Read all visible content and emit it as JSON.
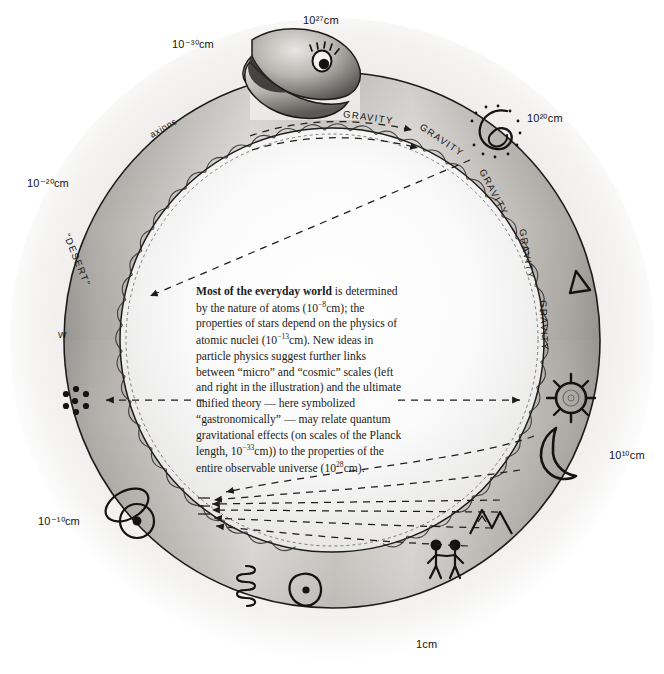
{
  "figure": {
    "type": "ouroboros-scale-diagram",
    "title_text": "Ouroboros of scales",
    "background": "#ffffff",
    "halo_color": "#e9e9e9",
    "snake_light": "#f2f0ee",
    "snake_mid": "#a9a6a2",
    "snake_dark": "#3a3836",
    "ink": "#151515"
  },
  "caption": {
    "lead": "Most of the everyday world",
    "body_1": " is determined by the nature of atoms (10",
    "exp_atom": "−8",
    "body_2": "cm); the properties of stars depend on the physics of atomic nuclei (10",
    "exp_nucleus": "−13",
    "body_3": "cm). New ideas in particle physics suggest further links between “micro” and “cosmic” scales (left and right in the illustration) and the ultimate unified theory — here symbolized “gastronomically” — may relate quantum gravitational effects (on scales of the Planck length, 10",
    "exp_planck": "−33",
    "body_4": "cm)) to the properties of the entire observable universe (10",
    "exp_universe": "28",
    "body_5": "cm)."
  },
  "scale_labels": [
    {
      "id": "top",
      "base": "10",
      "exp": "27",
      "unit": "cm",
      "text": "10²⁷cm",
      "x": 303,
      "y": 14,
      "angle_deg": 90
    },
    {
      "id": "upper-left",
      "base": "10",
      "exp": "−30",
      "unit": "cm",
      "text": "10⁻³⁰cm",
      "x": 172,
      "y": 38,
      "angle_deg": 125
    },
    {
      "id": "left",
      "base": "10",
      "exp": "−20",
      "unit": "cm",
      "text": "10⁻²⁰cm",
      "x": 27,
      "y": 177,
      "angle_deg": 160
    },
    {
      "id": "lower-left",
      "base": "10",
      "exp": "−10",
      "unit": "cm",
      "text": "10⁻¹⁰cm",
      "x": 38,
      "y": 515,
      "angle_deg": 205
    },
    {
      "id": "bottom",
      "base": "1",
      "exp": "",
      "unit": "cm",
      "text": "1cm",
      "x": 416,
      "y": 638,
      "angle_deg": 270
    },
    {
      "id": "lower-right",
      "base": "10",
      "exp": "10",
      "unit": "cm",
      "text": "10¹⁰cm",
      "x": 609,
      "y": 449,
      "angle_deg": 330
    },
    {
      "id": "upper-right",
      "base": "10",
      "exp": "20",
      "unit": "cm",
      "text": "10²⁰cm",
      "x": 527,
      "y": 112,
      "angle_deg": 55
    }
  ],
  "body_words": [
    {
      "id": "gravity-1",
      "text": "GRAVITY",
      "x": 344,
      "y": 108,
      "rotate": 8
    },
    {
      "id": "gravity-2",
      "text": "GRAVITY",
      "x": 424,
      "y": 121,
      "rotate": 34
    },
    {
      "id": "gravity-3",
      "text": "GRAVITY",
      "x": 487,
      "y": 167,
      "rotate": 62
    },
    {
      "id": "gravity-4",
      "text": "GRAVITY",
      "x": 528,
      "y": 228,
      "rotate": 80
    },
    {
      "id": "gravity-5",
      "text": "GRAVITY",
      "x": 549,
      "y": 300,
      "rotate": 88
    },
    {
      "id": "axions",
      "text": "axions",
      "x": 148,
      "y": 131,
      "rotate": -30
    },
    {
      "id": "desert",
      "text": "“DESERT”",
      "x": 72,
      "y": 232,
      "rotate": 68
    },
    {
      "id": "wboson",
      "text": "W",
      "x": 58,
      "y": 330,
      "rotate": 0
    }
  ],
  "symbols": [
    {
      "id": "eye",
      "name": "snake-eye-icon",
      "x": 321,
      "y": 60,
      "label": "eye of the serpent"
    },
    {
      "id": "spiral-galaxy",
      "name": "spiral-galaxy-icon",
      "x": 490,
      "y": 132,
      "label": "spiral galaxy"
    },
    {
      "id": "triangle",
      "name": "triangle-icon",
      "x": 580,
      "y": 281,
      "label": "triangle / pyramid"
    },
    {
      "id": "sun",
      "name": "sun-icon",
      "x": 571,
      "y": 398,
      "label": "sun"
    },
    {
      "id": "moon",
      "name": "crescent-moon-icon",
      "x": 563,
      "y": 449,
      "label": "crescent moon"
    },
    {
      "id": "mountains",
      "name": "mountains-icon",
      "x": 489,
      "y": 523,
      "label": "mountains"
    },
    {
      "id": "people",
      "name": "people-icon",
      "x": 444,
      "y": 553,
      "label": "two human figures"
    },
    {
      "id": "cell",
      "name": "cell-icon",
      "x": 305,
      "y": 590,
      "label": "living cell"
    },
    {
      "id": "dna",
      "name": "dna-helix-icon",
      "x": 254,
      "y": 586,
      "label": "DNA helix"
    },
    {
      "id": "atom",
      "name": "atom-icon",
      "x": 127,
      "y": 515,
      "label": "atom with orbital"
    },
    {
      "id": "nucleus",
      "name": "nucleus-icon",
      "x": 75,
      "y": 401,
      "label": "atomic nucleus"
    }
  ],
  "arrows": {
    "style": "dashed",
    "count": 12,
    "description": "dashed double-headed arrows linking micro scales on the left to cosmic scales on the right"
  }
}
